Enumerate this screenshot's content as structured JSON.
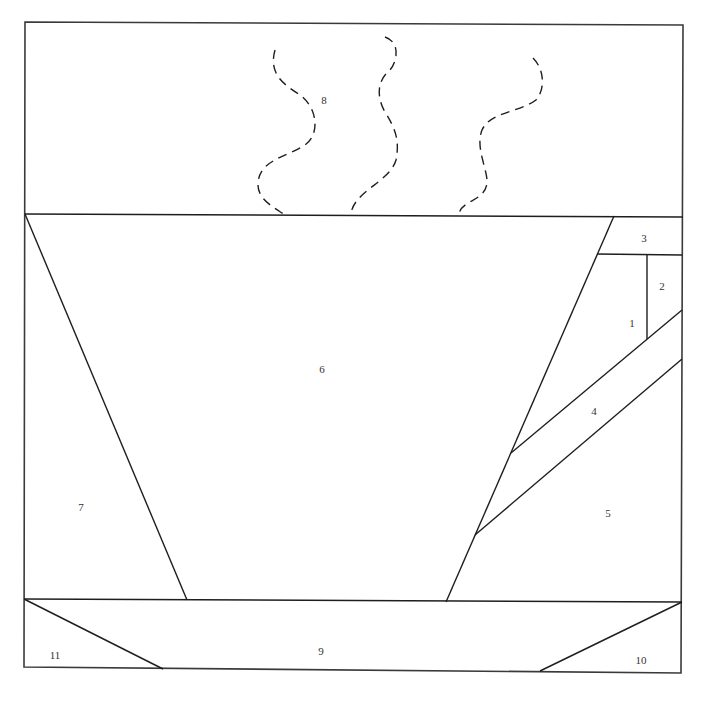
{
  "pieces": [
    {
      "id": "1",
      "label": "1",
      "x": 632,
      "y": 323
    },
    {
      "id": "2",
      "label": "2",
      "x": 662,
      "y": 286
    },
    {
      "id": "3",
      "label": "3",
      "x": 644,
      "y": 238
    },
    {
      "id": "4",
      "label": "4",
      "x": 594,
      "y": 411
    },
    {
      "id": "5",
      "label": "5",
      "x": 608,
      "y": 513
    },
    {
      "id": "6",
      "label": "6",
      "x": 322,
      "y": 369
    },
    {
      "id": "7",
      "label": "7",
      "x": 81,
      "y": 507
    },
    {
      "id": "8",
      "label": "8",
      "x": 324,
      "y": 100
    },
    {
      "id": "9",
      "label": "9",
      "x": 321,
      "y": 651
    },
    {
      "id": "10",
      "label": "10",
      "x": 641,
      "y": 660
    },
    {
      "id": "11",
      "label": "11",
      "x": 55,
      "y": 655
    }
  ],
  "colors": {
    "line": "#1e1e1e",
    "background": "#ffffff"
  }
}
